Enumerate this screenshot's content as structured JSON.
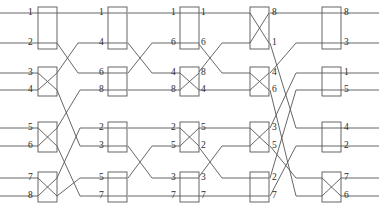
{
  "diagram": {
    "type": "switching-network",
    "width": 379,
    "height": 223,
    "line_color": "#555555",
    "box_color": "#555555",
    "text_color": "#2b2b2b",
    "background": "#ffffff",
    "inputs": 8,
    "stages": 5,
    "row_y": [
      13,
      43,
      73,
      90,
      128,
      146,
      178,
      196
    ],
    "column_x": [
      38,
      108,
      180,
      250,
      322
    ],
    "box_width": 19,
    "switch_states": [
      [
        "bar",
        "cross",
        "cross",
        "cross"
      ],
      [
        "bar",
        "bar",
        "bar",
        "bar"
      ],
      [
        "bar",
        "cross",
        "cross",
        "bar"
      ],
      [
        "cross",
        "cross",
        "cross",
        "bar"
      ],
      [
        "bar",
        "bar",
        "bar",
        "cross"
      ]
    ],
    "labels": [
      {
        "name": "in-1",
        "text": "1",
        "x": 28,
        "y": 8
      },
      {
        "name": "in-2",
        "text": "2",
        "x": 28,
        "y": 38
      },
      {
        "name": "in-3",
        "text": "3",
        "x": 28,
        "y": 68
      },
      {
        "name": "in-4",
        "text": "4",
        "x": 28,
        "y": 85
      },
      {
        "name": "in-5",
        "text": "5",
        "x": 28,
        "y": 123
      },
      {
        "name": "in-6",
        "text": "6",
        "x": 28,
        "y": 141
      },
      {
        "name": "in-7",
        "text": "7",
        "x": 28,
        "y": 173
      },
      {
        "name": "in-8",
        "text": "8",
        "x": 28,
        "y": 191
      },
      {
        "name": "s2-in-1",
        "text": "1",
        "x": 99,
        "y": 8
      },
      {
        "name": "s2-in-2",
        "text": "4",
        "x": 99,
        "y": 38
      },
      {
        "name": "s2-in-3",
        "text": "6",
        "x": 99,
        "y": 68
      },
      {
        "name": "s2-in-4",
        "text": "8",
        "x": 99,
        "y": 85
      },
      {
        "name": "s2-in-5",
        "text": "2",
        "x": 99,
        "y": 123
      },
      {
        "name": "s2-in-6",
        "text": "3",
        "x": 99,
        "y": 141
      },
      {
        "name": "s2-in-7",
        "text": "5",
        "x": 99,
        "y": 173
      },
      {
        "name": "s2-in-8",
        "text": "7",
        "x": 99,
        "y": 191
      },
      {
        "name": "s3-in-1",
        "text": "1",
        "x": 171,
        "y": 8
      },
      {
        "name": "s3-in-2",
        "text": "6",
        "x": 171,
        "y": 38
      },
      {
        "name": "s3-in-3",
        "text": "4",
        "x": 171,
        "y": 68
      },
      {
        "name": "s3-in-4",
        "text": "8",
        "x": 171,
        "y": 85
      },
      {
        "name": "s3-in-5",
        "text": "2",
        "x": 171,
        "y": 123
      },
      {
        "name": "s3-in-6",
        "text": "5",
        "x": 171,
        "y": 141
      },
      {
        "name": "s3-in-7",
        "text": "3",
        "x": 171,
        "y": 173
      },
      {
        "name": "s3-in-8",
        "text": "7",
        "x": 171,
        "y": 191
      },
      {
        "name": "s3-out-1",
        "text": "1",
        "x": 201,
        "y": 8
      },
      {
        "name": "s3-out-2",
        "text": "6",
        "x": 201,
        "y": 38
      },
      {
        "name": "s3-out-3",
        "text": "8",
        "x": 201,
        "y": 68
      },
      {
        "name": "s3-out-4",
        "text": "4",
        "x": 201,
        "y": 85
      },
      {
        "name": "s3-out-5",
        "text": "5",
        "x": 201,
        "y": 123
      },
      {
        "name": "s3-out-6",
        "text": "2",
        "x": 201,
        "y": 141
      },
      {
        "name": "s3-out-7",
        "text": "3",
        "x": 201,
        "y": 173
      },
      {
        "name": "s3-out-8",
        "text": "7",
        "x": 201,
        "y": 191
      },
      {
        "name": "s4-out-1",
        "text": "8",
        "x": 272,
        "y": 8
      },
      {
        "name": "s4-out-2",
        "text": "1",
        "x": 272,
        "y": 38
      },
      {
        "name": "s4-out-3",
        "text": "4",
        "x": 272,
        "y": 68
      },
      {
        "name": "s4-out-4",
        "text": "6",
        "x": 272,
        "y": 85
      },
      {
        "name": "s4-out-5",
        "text": "3",
        "x": 272,
        "y": 123
      },
      {
        "name": "s4-out-6",
        "text": "5",
        "x": 272,
        "y": 141
      },
      {
        "name": "s4-out-7",
        "text": "2",
        "x": 272,
        "y": 173
      },
      {
        "name": "s4-out-8",
        "text": "7",
        "x": 272,
        "y": 191
      },
      {
        "name": "out-1",
        "text": "8",
        "x": 344,
        "y": 8
      },
      {
        "name": "out-2",
        "text": "3",
        "x": 344,
        "y": 38
      },
      {
        "name": "out-3",
        "text": "1",
        "x": 344,
        "y": 68
      },
      {
        "name": "out-4",
        "text": "5",
        "x": 344,
        "y": 85
      },
      {
        "name": "out-5",
        "text": "4",
        "x": 344,
        "y": 123
      },
      {
        "name": "out-6",
        "text": "2",
        "x": 344,
        "y": 141
      },
      {
        "name": "out-7",
        "text": "7",
        "x": 344,
        "y": 173
      },
      {
        "name": "out-8",
        "text": "6",
        "x": 344,
        "y": 191
      }
    ],
    "wires": [
      {
        "name": "wire-in-1",
        "d": "M 0 13 L 38 13"
      },
      {
        "name": "wire-in-2",
        "d": "M 0 43 L 38 43"
      },
      {
        "name": "wire-in-3",
        "d": "M 0 73 L 38 73"
      },
      {
        "name": "wire-in-4",
        "d": "M 0 90 L 38 90"
      },
      {
        "name": "wire-in-5",
        "d": "M 0 128 L 38 128"
      },
      {
        "name": "wire-in-6",
        "d": "M 0 146 L 38 146"
      },
      {
        "name": "wire-in-7",
        "d": "M 0 178 L 38 178"
      },
      {
        "name": "wire-in-8",
        "d": "M 0 196 L 38 196"
      },
      {
        "name": "link-s1-s2-a",
        "d": "M 57 13 L 108 13"
      },
      {
        "name": "link-s1-s2-b",
        "d": "M 57 43 L 78 73 L 95 73 L 108 73"
      },
      {
        "name": "link-s1-s2-c",
        "d": "M 57 73 L 78 43 L 95 43 L 108 43"
      },
      {
        "name": "link-s1-s2-d",
        "d": "M 57 90 L 80 146 L 98 146 L 108 146"
      },
      {
        "name": "link-s1-s2-e",
        "d": "M 57 128 L 80 90 L 98 90 L 108 90"
      },
      {
        "name": "link-s1-s2-f",
        "d": "M 57 146 L 80 196 L 98 196 L 108 196"
      },
      {
        "name": "link-s1-s2-g",
        "d": "M 57 178 L 80 128 L 98 128 L 108 128"
      },
      {
        "name": "link-s1-s2-h",
        "d": "M 57 196 L 80 178 L 98 178 L 108 178"
      },
      {
        "name": "link-s2-s3-a",
        "d": "M 128 13 L 180 13"
      },
      {
        "name": "link-s2-s3-b",
        "d": "M 128 43 L 152 73 L 168 73 L 180 73"
      },
      {
        "name": "link-s2-s3-c",
        "d": "M 128 73 L 152 43 L 168 43 L 180 43"
      },
      {
        "name": "link-s2-s3-d",
        "d": "M 128 90 L 180 90"
      },
      {
        "name": "link-s2-s3-e",
        "d": "M 128 128 L 180 128"
      },
      {
        "name": "link-s2-s3-f",
        "d": "M 128 146 L 152 178 L 168 178 L 180 178"
      },
      {
        "name": "link-s2-s3-g",
        "d": "M 128 178 L 152 146 L 168 146 L 180 146"
      },
      {
        "name": "link-s2-s3-h",
        "d": "M 128 196 L 180 196"
      },
      {
        "name": "link-s3-s4-a",
        "d": "M 198 13 L 250 13"
      },
      {
        "name": "link-s3-s4-b",
        "d": "M 198 43 L 222 73 L 238 73 L 250 73"
      },
      {
        "name": "link-s3-s4-c",
        "d": "M 198 73 L 222 43 L 238 43 L 250 43"
      },
      {
        "name": "link-s3-s4-d",
        "d": "M 198 90 L 250 90"
      },
      {
        "name": "link-s3-s4-e",
        "d": "M 198 128 L 250 128"
      },
      {
        "name": "link-s3-s4-f",
        "d": "M 198 146 L 222 178 L 238 178 L 250 178"
      },
      {
        "name": "link-s3-s4-g",
        "d": "M 198 178 L 222 146 L 238 146 L 250 146"
      },
      {
        "name": "link-s3-s4-h",
        "d": "M 198 196 L 250 196"
      },
      {
        "name": "link-s4-s5-a",
        "d": "M 270 13 L 322 13"
      },
      {
        "name": "link-s4-s5-b",
        "d": "M 270 43 L 296 128 L 312 128 L 322 128"
      },
      {
        "name": "link-s4-s5-c",
        "d": "M 270 73 L 296 43 L 312 43 L 322 43"
      },
      {
        "name": "link-s4-s5-d",
        "d": "M 270 90 L 296 196 L 312 196 L 322 196"
      },
      {
        "name": "link-s4-s5-e",
        "d": "M 270 128 L 296 73 L 312 73 L 322 73"
      },
      {
        "name": "link-s4-s5-f",
        "d": "M 270 146 L 296 178 L 312 178 L 322 178"
      },
      {
        "name": "link-s4-s5-g",
        "d": "M 270 178 L 296 90 L 312 90 L 322 90"
      },
      {
        "name": "link-s4-s5-h",
        "d": "M 270 196 L 296 146 L 312 146 L 322 146"
      },
      {
        "name": "wire-out-1",
        "d": "M 340 13 L 379 13"
      },
      {
        "name": "wire-out-2",
        "d": "M 340 43 L 379 43"
      },
      {
        "name": "wire-out-3",
        "d": "M 340 73 L 379 73"
      },
      {
        "name": "wire-out-4",
        "d": "M 340 90 L 379 90"
      },
      {
        "name": "wire-out-5",
        "d": "M 340 128 L 379 128"
      },
      {
        "name": "wire-out-6",
        "d": "M 340 146 L 379 146"
      },
      {
        "name": "wire-out-7",
        "d": "M 340 178 L 379 178"
      },
      {
        "name": "wire-out-8",
        "d": "M 340 196 L 379 196"
      }
    ]
  }
}
